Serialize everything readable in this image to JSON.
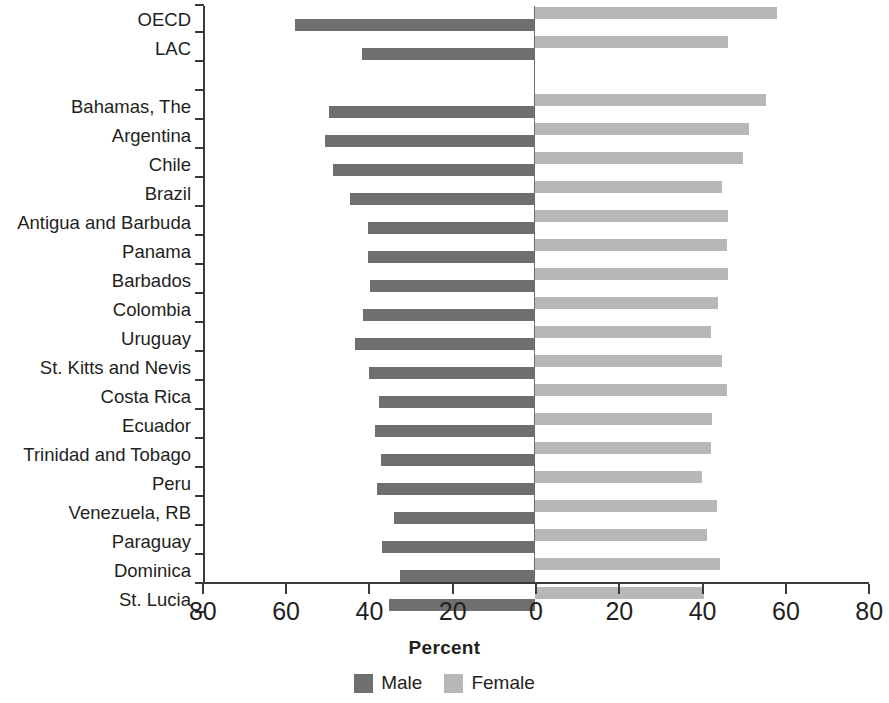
{
  "chart_data": {
    "type": "bar",
    "subtype": "diverging-population-pyramid",
    "title": "",
    "xlabel": "Percent",
    "ylabel": "",
    "xlim": [
      -80,
      80
    ],
    "xticks": [
      -80,
      -60,
      -40,
      -20,
      0,
      20,
      40,
      60,
      80
    ],
    "xtick_labels": [
      "80",
      "60",
      "40",
      "20",
      "0",
      "20",
      "40",
      "60",
      "80"
    ],
    "grid": false,
    "legend_position": "bottom-center",
    "orientation": "horizontal",
    "note": "Male values extend leftward from zero; Female values extend rightward from zero. A blank spacer row separates the aggregate rows (OECD, LAC) from the individual economies.",
    "categories": [
      "OECD",
      "LAC",
      "Bahamas, The",
      "Argentina",
      "Chile",
      "Brazil",
      "Antigua and Barbuda",
      "Panama",
      "Barbados",
      "Colombia",
      "Uruguay",
      "St. Kitts and Nevis",
      "Costa Rica",
      "Ecuador",
      "Trinidad and Tobago",
      "Peru",
      "Venezuela, RB",
      "Paraguay",
      "Dominica",
      "St. Lucia"
    ],
    "series": [
      {
        "name": "Male",
        "color": "#6f6f6f",
        "direction": "left",
        "values": [
          57.6,
          41.5,
          49.4,
          50.4,
          48.4,
          44.4,
          40.0,
          40.0,
          39.6,
          41.3,
          43.2,
          39.8,
          37.4,
          38.4,
          36.9,
          37.9,
          33.8,
          36.7,
          32.4,
          35.0
        ]
      },
      {
        "name": "Female",
        "color": "#b7b7b7",
        "direction": "right",
        "values": [
          58.0,
          46.3,
          55.4,
          51.3,
          49.9,
          44.8,
          46.3,
          46.0,
          46.3,
          43.9,
          42.2,
          44.8,
          46.0,
          42.4,
          42.2,
          40.0,
          43.7,
          41.2,
          44.4,
          40.5
        ]
      }
    ]
  },
  "axis": {
    "x_title": "Percent"
  },
  "legend": {
    "items": [
      {
        "label": "Male",
        "color": "#6f6f6f"
      },
      {
        "label": "Female",
        "color": "#b7b7b7"
      }
    ]
  },
  "colors": {
    "male": "#6f6f6f",
    "female": "#b7b7b7",
    "axis": "#3a3a3a",
    "text": "#231f20",
    "background": "#ffffff"
  }
}
